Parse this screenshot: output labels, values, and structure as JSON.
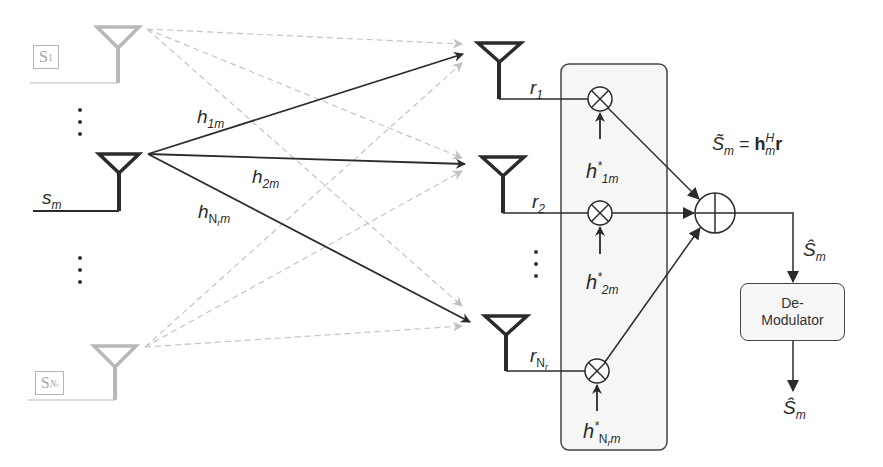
{
  "diagram": {
    "type": "MIMO receive maximal-ratio combining block diagram",
    "transmitters": [
      {
        "id": "s1",
        "label": "S",
        "sub": "1",
        "state": "inactive"
      },
      {
        "id": "sm",
        "label": "s",
        "sub": "m",
        "state": "active"
      },
      {
        "id": "sNt",
        "label": "S",
        "sub": "N",
        "subsub": "t",
        "state": "inactive"
      }
    ],
    "channels": [
      {
        "label": "h",
        "sub": "1m"
      },
      {
        "label": "h",
        "sub": "2m"
      },
      {
        "label": "h",
        "sub": "N",
        "subsub": "r",
        "sub_tail": "m"
      }
    ],
    "receivers": [
      {
        "label": "r",
        "sub": "1"
      },
      {
        "label": "r",
        "sub": "2"
      },
      {
        "label": "r",
        "sub": "N",
        "subsub": "r"
      }
    ],
    "weights": [
      {
        "label": "h",
        "sup": "*",
        "sub": "1m"
      },
      {
        "label": "h",
        "sup": "*",
        "sub": "2m"
      },
      {
        "label": "h",
        "sup": "*",
        "sub": "N",
        "subsub": "r",
        "sub_tail": "m"
      }
    ],
    "combiner_equation": {
      "lhs": "S̃",
      "lhs_sub": "m",
      "eq": "=",
      "rhs_bold": "h",
      "rhs_sup": "H",
      "rhs_sub": "m",
      "rhs_tail": "r"
    },
    "sum_output": {
      "label": "Ŝ",
      "sub": "m"
    },
    "demodulator": {
      "line1": "De-",
      "line2": "Modulator"
    },
    "final_output": {
      "label": "Ŝ",
      "sub": "m"
    },
    "colors": {
      "active": "#2b2b2b",
      "inactive": "#b8b8b8",
      "combiner_fill": "#f6f6f6"
    }
  }
}
